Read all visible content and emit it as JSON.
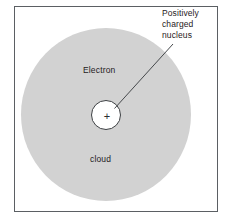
{
  "figure": {
    "frame": {
      "border_color": "#5b5f63",
      "background": "#ffffff"
    },
    "labels": {
      "electron": "Electron",
      "cloud": "cloud",
      "nucleus_charge_symbol": "+"
    },
    "callout": {
      "lines": [
        "Positively",
        "charged",
        "nucleus"
      ],
      "line1": "Positively",
      "line2": "charged",
      "line3": "nucleus"
    },
    "icons": {
      "electron_cloud": "filled-circle-icon",
      "nucleus": "outlined-circle-icon",
      "leader": "leader-line-icon"
    },
    "colors": {
      "electron_cloud_fill": "#d2d2d2",
      "nucleus_fill": "#ffffff",
      "nucleus_stroke": "#3d4043",
      "leader_line": "#46494c",
      "text": "#1f2123",
      "page_background": "#ffffff"
    }
  }
}
